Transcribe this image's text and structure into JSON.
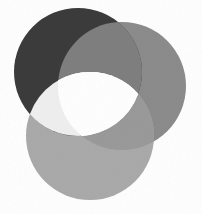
{
  "figure": {
    "type": "venn",
    "background_color": "#ffffff",
    "width": 202,
    "height": 214
  },
  "chart_data": {
    "type": "venn",
    "title": "",
    "subtitle": "",
    "xlabel": "",
    "ylabel": "",
    "grid": false,
    "legend_position": "none",
    "set_count": 3,
    "blend_mode": "multiply-with-light-core",
    "background_color": "#ffffff",
    "canvas": {
      "width": 202,
      "height": 214
    },
    "sets": [
      {
        "id": "A",
        "name": "Set A",
        "label": "",
        "color": "#3b3b3b",
        "opacity": 1.0,
        "cx": 78,
        "cy": 72,
        "r": 64
      },
      {
        "id": "B",
        "name": "Set B",
        "label": "",
        "color": "#8c8c8c",
        "opacity": 1.0,
        "cx": 122,
        "cy": 86,
        "r": 64
      },
      {
        "id": "C",
        "name": "Set C",
        "label": "",
        "color": "#aaaaaa",
        "opacity": 1.0,
        "cx": 90,
        "cy": 136,
        "r": 64
      }
    ],
    "regions": [
      {
        "id": "A_only",
        "sets": [
          "A"
        ],
        "color": "#3b3b3b"
      },
      {
        "id": "B_only",
        "sets": [
          "B"
        ],
        "color": "#8c8c8c"
      },
      {
        "id": "C_only",
        "sets": [
          "C"
        ],
        "color": "#aaaaaa"
      },
      {
        "id": "A_and_B",
        "sets": [
          "A",
          "B"
        ],
        "color": "#7f7f7f"
      },
      {
        "id": "A_and_C",
        "sets": [
          "A",
          "C"
        ],
        "color": "#efefef"
      },
      {
        "id": "B_and_C",
        "sets": [
          "B",
          "C"
        ],
        "color": "#9a9a9a"
      },
      {
        "id": "A_B_C",
        "sets": [
          "A",
          "B",
          "C"
        ],
        "color": "#fbfbfb"
      }
    ],
    "annotations": []
  }
}
